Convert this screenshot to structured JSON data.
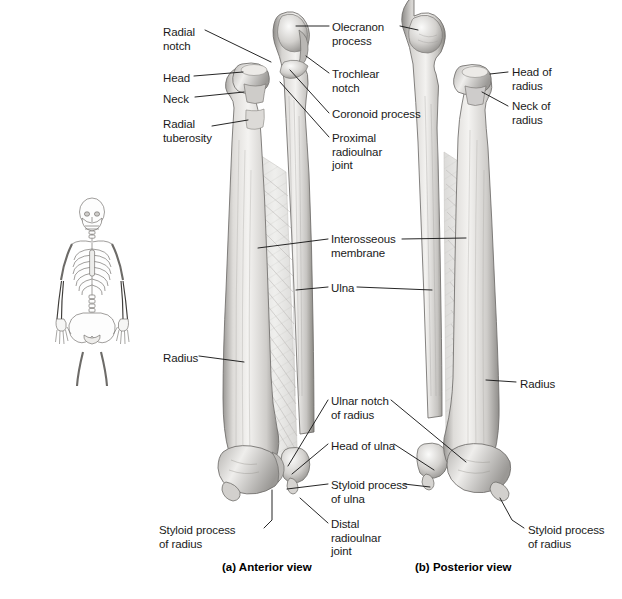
{
  "figure": {
    "title_none": "",
    "captions": [
      {
        "id": "caption-a",
        "text": "(a) Anterior view",
        "x": 222,
        "y": 561
      },
      {
        "id": "caption-b",
        "text": "(b) Posterior view",
        "x": 415,
        "y": 561
      }
    ],
    "orientation_icon": {
      "name": "skeleton-orientation-figure",
      "x": 30,
      "y": 195,
      "w": 125,
      "h": 160
    }
  },
  "labels": {
    "left_column": [
      {
        "id": "radial-notch",
        "text": "Radial\nnotch",
        "x": 163,
        "y": 26,
        "align": "left"
      },
      {
        "id": "head",
        "text": "Head",
        "x": 163,
        "y": 72,
        "align": "left"
      },
      {
        "id": "neck",
        "text": "Neck",
        "x": 163,
        "y": 93,
        "align": "left"
      },
      {
        "id": "radial-tuberosity",
        "text": "Radial\ntuberosity",
        "x": 163,
        "y": 118,
        "align": "left"
      },
      {
        "id": "radius-left",
        "text": "Radius",
        "x": 163,
        "y": 352,
        "align": "left"
      },
      {
        "id": "styloid-process-of-radius-left",
        "text": "Styloid process\nof radius",
        "x": 159,
        "y": 524,
        "align": "left"
      }
    ],
    "center_column": [
      {
        "id": "olecranon-process",
        "text": "Olecranon\nprocess",
        "x": 332,
        "y": 21,
        "align": "left"
      },
      {
        "id": "trochlear-notch",
        "text": "Trochlear\nnotch",
        "x": 332,
        "y": 68,
        "align": "left"
      },
      {
        "id": "coronoid-process",
        "text": "Coronoid process",
        "x": 332,
        "y": 108,
        "align": "left"
      },
      {
        "id": "proximal-radioulnar-joint",
        "text": "Proximal\nradioulnar\njoint",
        "x": 332,
        "y": 132,
        "align": "left"
      },
      {
        "id": "interosseous-membrane",
        "text": "Interosseous\nmembrane",
        "x": 331,
        "y": 233,
        "align": "left"
      },
      {
        "id": "ulna",
        "text": "Ulna",
        "x": 331,
        "y": 282,
        "align": "left"
      },
      {
        "id": "ulnar-notch-of-radius",
        "text": "Ulnar notch\nof radius",
        "x": 331,
        "y": 395,
        "align": "left"
      },
      {
        "id": "head-of-ulna",
        "text": "Head of ulna",
        "x": 331,
        "y": 440,
        "align": "left"
      },
      {
        "id": "styloid-process-of-ulna",
        "text": "Styloid process\nof ulna",
        "x": 331,
        "y": 479,
        "align": "left"
      },
      {
        "id": "distal-radioulnar-joint",
        "text": "Distal\nradioulnar\njoint",
        "x": 331,
        "y": 518,
        "align": "left"
      }
    ],
    "right_column": [
      {
        "id": "head-of-radius",
        "text": "Head of\nradius",
        "x": 512,
        "y": 66,
        "align": "left"
      },
      {
        "id": "neck-of-radius",
        "text": "Neck of\nradius",
        "x": 512,
        "y": 100,
        "align": "left"
      },
      {
        "id": "radius-right",
        "text": "Radius",
        "x": 520,
        "y": 378,
        "align": "left"
      },
      {
        "id": "styloid-process-of-radius-right",
        "text": "Styloid process\nof radius",
        "x": 528,
        "y": 524,
        "align": "left"
      }
    ]
  },
  "bones": {
    "anterior": {
      "name": "anterior-view-radius-ulna",
      "left_bone": "radius",
      "right_bone": "ulna"
    },
    "posterior": {
      "name": "posterior-view-radius-ulna",
      "left_bone": "ulna",
      "right_bone": "radius"
    }
  },
  "colors": {
    "leader_line": "#1a1a1a",
    "bone_light": "#f2f1ef",
    "bone_mid": "#c9c7c4",
    "bone_dark": "#8e8c89",
    "bone_outline": "#6f6d6a",
    "membrane": "#e4e3e1",
    "text": "#1a1a1a",
    "background": "#ffffff"
  }
}
